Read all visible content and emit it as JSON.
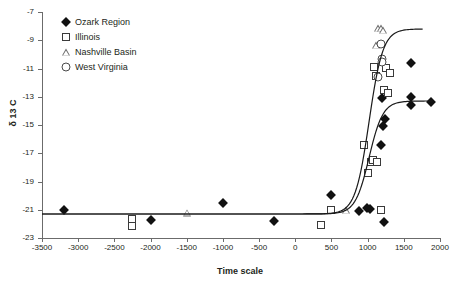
{
  "chart_data": {
    "type": "scatter",
    "title": "",
    "xlabel": "Time scale",
    "ylabel": "δ 13 C",
    "xlim": [
      -3500,
      2000
    ],
    "ylim": [
      -23,
      -7
    ],
    "xticks": [
      -3500,
      -3000,
      -2500,
      -2000,
      -1500,
      -1000,
      -500,
      0,
      500,
      1000,
      1500,
      2000
    ],
    "yticks": [
      -7,
      -9,
      -11,
      -13,
      -15,
      -17,
      -19,
      -21,
      -23
    ],
    "grid": false,
    "legend_position": "top-left",
    "series": [
      {
        "name": "Ozark Region",
        "marker": "filled-diamond",
        "color": "#111111",
        "points": [
          [
            -3200,
            -21.05
          ],
          [
            -2000,
            -21.75
          ],
          [
            -1000,
            -20.55
          ],
          [
            -300,
            -21.8
          ],
          [
            500,
            -19.95
          ],
          [
            880,
            -21.1
          ],
          [
            990,
            -20.85
          ],
          [
            1030,
            -20.95
          ],
          [
            1190,
            -16.4
          ],
          [
            1200,
            -13.1
          ],
          [
            1210,
            -15.05
          ],
          [
            1245,
            -14.55
          ],
          [
            1230,
            -21.85
          ],
          [
            1600,
            -10.6
          ],
          [
            1600,
            -13.0
          ],
          [
            1600,
            -13.55
          ],
          [
            1880,
            -13.4
          ]
        ]
      },
      {
        "name": "Illinois",
        "marker": "open-square",
        "color": "#3a3a3a",
        "points": [
          [
            -2250,
            -21.65
          ],
          [
            -2250,
            -22.15
          ],
          [
            350,
            -22.1
          ],
          [
            500,
            -21.05
          ],
          [
            950,
            -16.45
          ],
          [
            1010,
            -18.4
          ],
          [
            1040,
            -17.6
          ],
          [
            1075,
            -17.45
          ],
          [
            1090,
            -10.9
          ],
          [
            1110,
            -11.5
          ],
          [
            1135,
            -17.6
          ],
          [
            1190,
            -21.0
          ],
          [
            1230,
            -12.5
          ],
          [
            1255,
            -10.95
          ],
          [
            1280,
            -12.75
          ],
          [
            1310,
            -11.35
          ]
        ]
      },
      {
        "name": "Nashville Basin",
        "marker": "open-triangle",
        "color": "#6a6a6a",
        "points": [
          [
            -1500,
            -21.2
          ],
          [
            700,
            -21.05
          ],
          [
            1120,
            -9.35
          ],
          [
            1150,
            -8.15
          ],
          [
            1185,
            -8.15
          ],
          [
            1215,
            -8.3
          ]
        ]
      },
      {
        "name": "West Virginia",
        "marker": "open-circle",
        "color": "#4a4a4a",
        "points": [
          [
            1150,
            -11.6
          ],
          [
            1185,
            -9.3
          ],
          [
            1200,
            -10.35
          ],
          [
            1205,
            -10.55
          ]
        ]
      }
    ],
    "fit_curves": [
      {
        "name": "upper-sigmoid",
        "plateau_low": -21.3,
        "plateau_high": -8.2,
        "x_end": 1760
      },
      {
        "name": "lower-sigmoid",
        "plateau_low": -21.3,
        "plateau_high": -13.3,
        "x_end": 1900
      }
    ]
  },
  "legend": {
    "items": [
      {
        "label": "Ozark Region",
        "marker": "filled-diamond"
      },
      {
        "label": "Illinois",
        "marker": "open-square"
      },
      {
        "label": "Nashville Basin",
        "marker": "open-triangle"
      },
      {
        "label": "West Virginia",
        "marker": "open-circle"
      }
    ]
  }
}
